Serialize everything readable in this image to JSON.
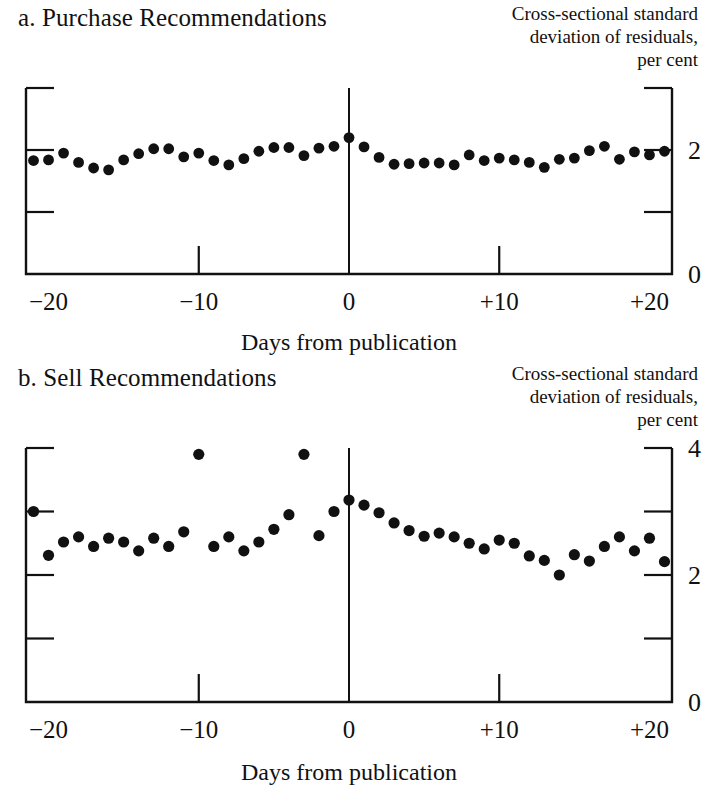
{
  "figure": {
    "yaxis_caption_lines": [
      "Cross-sectional standard",
      "deviation of residuals,",
      "per cent"
    ],
    "xaxis_title": "Days from publication"
  },
  "chart_data": [
    {
      "type": "scatter",
      "title": "a. Purchase Recommendations",
      "panel_label": "a.",
      "xlabel": "Days from publication",
      "ylabel": "Cross-sectional standard deviation of residuals, per cent",
      "xlim": [
        -21.5,
        21.5
      ],
      "ylim": [
        0,
        3
      ],
      "xticks": [
        -20,
        -10,
        0,
        10,
        20
      ],
      "xticklabels": [
        "−20",
        "−10",
        "0",
        "+10",
        "+20"
      ],
      "yticks": [
        0,
        1,
        2,
        3
      ],
      "yticklabels": [
        "0",
        "",
        "2",
        ""
      ],
      "grid": false,
      "legend": "none",
      "event_line_x": 0,
      "x": [
        -21,
        -20,
        -19,
        -18,
        -17,
        -16,
        -15,
        -14,
        -13,
        -12,
        -11,
        -10,
        -9,
        -8,
        -7,
        -6,
        -5,
        -4,
        -3,
        -2,
        -1,
        0,
        1,
        2,
        3,
        4,
        5,
        6,
        7,
        8,
        9,
        10,
        11,
        12,
        13,
        14,
        15,
        16,
        17,
        18,
        19,
        20,
        21
      ],
      "values": [
        1.83,
        1.84,
        1.95,
        1.8,
        1.71,
        1.68,
        1.84,
        1.94,
        2.02,
        2.02,
        1.89,
        1.95,
        1.83,
        1.76,
        1.86,
        1.98,
        2.04,
        2.04,
        1.91,
        2.03,
        2.06,
        2.2,
        2.05,
        1.88,
        1.77,
        1.78,
        1.79,
        1.79,
        1.76,
        1.92,
        1.83,
        1.87,
        1.84,
        1.8,
        1.72,
        1.85,
        1.87,
        1.99,
        2.06,
        1.85,
        1.97,
        1.92,
        1.98
      ]
    },
    {
      "type": "scatter",
      "title": "b. Sell Recommendations",
      "panel_label": "b.",
      "xlabel": "Days from publication",
      "ylabel": "Cross-sectional standard deviation of residuals, per cent",
      "xlim": [
        -21.5,
        21.5
      ],
      "ylim": [
        0,
        4
      ],
      "xticks": [
        -20,
        -10,
        0,
        10,
        20
      ],
      "xticklabels": [
        "−20",
        "−10",
        "0",
        "+10",
        "+20"
      ],
      "yticks": [
        0,
        1,
        2,
        3,
        4
      ],
      "yticklabels": [
        "0",
        "",
        "2",
        "",
        "4"
      ],
      "grid": false,
      "legend": "none",
      "event_line_x": 0,
      "x": [
        -21,
        -20,
        -19,
        -18,
        -17,
        -16,
        -15,
        -14,
        -13,
        -12,
        -11,
        -10,
        -9,
        -8,
        -7,
        -6,
        -5,
        -4,
        -3,
        -2,
        -1,
        0,
        1,
        2,
        3,
        4,
        5,
        6,
        7,
        8,
        9,
        10,
        11,
        12,
        13,
        14,
        15,
        16,
        17,
        18,
        19,
        20,
        21
      ],
      "values": [
        3.0,
        2.31,
        2.52,
        2.6,
        2.45,
        2.58,
        2.52,
        2.38,
        2.58,
        2.45,
        2.68,
        3.9,
        2.45,
        2.6,
        2.38,
        2.52,
        2.72,
        2.95,
        3.9,
        2.62,
        3.0,
        3.18,
        3.1,
        2.98,
        2.82,
        2.7,
        2.61,
        2.66,
        2.6,
        2.5,
        2.41,
        2.55,
        2.5,
        2.3,
        2.23,
        2.0,
        2.32,
        2.22,
        2.45,
        2.6,
        2.38,
        2.58,
        2.21
      ]
    }
  ]
}
